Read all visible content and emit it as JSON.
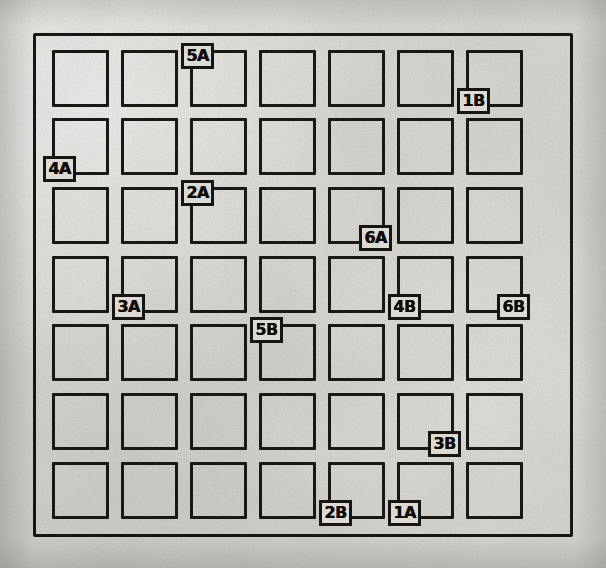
{
  "scene": {
    "title": "Hand-drawn 7x7 grid worksheet",
    "medium": "photocopied paper scan",
    "paper_color": "#dcdad5",
    "ink_color": "#17150f",
    "grid": {
      "rows": 7,
      "columns": 7
    },
    "frame": {
      "present": true,
      "style": "single rectangular outer border"
    }
  },
  "labels": [
    {
      "text": "5A",
      "row": 1,
      "col": 3,
      "corner": "top-left"
    },
    {
      "text": "1B",
      "row": 1,
      "col": 7,
      "corner": "bottom-left"
    },
    {
      "text": "4A",
      "row": 2,
      "col": 1,
      "corner": "bottom-left"
    },
    {
      "text": "2A",
      "row": 3,
      "col": 3,
      "corner": "top-left"
    },
    {
      "text": "6A",
      "row": 3,
      "col": 5,
      "corner": "bottom-right"
    },
    {
      "text": "3A",
      "row": 4,
      "col": 2,
      "corner": "bottom-left"
    },
    {
      "text": "4B",
      "row": 4,
      "col": 6,
      "corner": "bottom-left"
    },
    {
      "text": "6B",
      "row": 4,
      "col": 7,
      "corner": "bottom-right"
    },
    {
      "text": "5B",
      "row": 5,
      "col": 4,
      "corner": "top-left"
    },
    {
      "text": "3B",
      "row": 6,
      "col": 6,
      "corner": "bottom-right"
    },
    {
      "text": "2B",
      "row": 7,
      "col": 5,
      "corner": "bottom-left"
    },
    {
      "text": "1A",
      "row": 7,
      "col": 6,
      "corner": "bottom-left"
    }
  ],
  "geometry": {
    "col_x": [
      52,
      121,
      190,
      259,
      328,
      397,
      466
    ],
    "row_y": [
      50,
      118,
      187,
      256,
      324,
      393,
      462
    ],
    "cell_size": 57,
    "chip_offsets": {
      "top-left": {
        "dx": -9,
        "dy": -7
      },
      "bottom-left": {
        "dx": -9,
        "dy": 38
      },
      "bottom-right": {
        "dx": 31,
        "dy": 38
      }
    }
  }
}
